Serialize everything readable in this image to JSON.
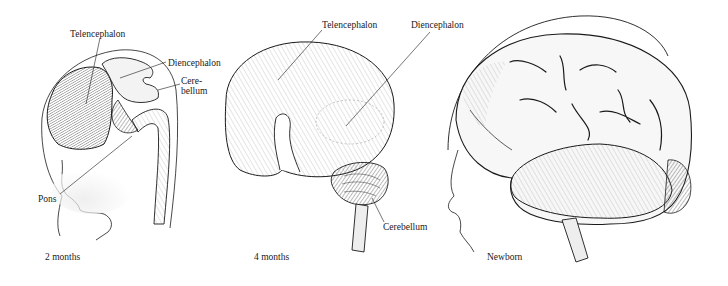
{
  "figure": {
    "panels": [
      {
        "id": "two-months",
        "caption": "2 months",
        "labels": {
          "telencephalon": "Telencephalon",
          "diencephalon": "Diencephalon",
          "cerebellum_line1": "Cere-",
          "cerebellum_line2": "bellum",
          "pons": "Pons"
        }
      },
      {
        "id": "four-months",
        "caption": "4 months",
        "labels": {
          "telencephalon": "Telencephalon",
          "diencephalon": "Diencephalon",
          "cerebellum": "Cerebellum"
        }
      },
      {
        "id": "newborn",
        "caption": "Newborn",
        "labels": {}
      }
    ],
    "colors": {
      "ink": "#1a1a1a",
      "shade": "#8a8a8a",
      "background": "#ffffff"
    }
  }
}
